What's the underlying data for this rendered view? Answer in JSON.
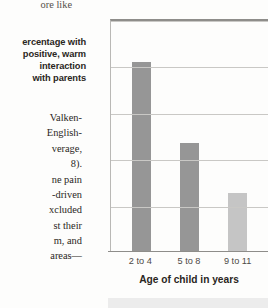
{
  "page": {
    "top_fragment": "ore like",
    "caption": "ercentage with\npositive, warm\ninteraction\nwith parents",
    "body_fragment_1": "Valken-\nEnglish-\nverage,\n8).\nne pain\n-driven\nxcluded\nst their\nm, and",
    "body_fragment_2": "areas—"
  },
  "chart_data": {
    "type": "bar",
    "title": "",
    "categories": [
      "2 to 4",
      "5 to 8",
      "9 to 11"
    ],
    "values": [
      81.5,
      47,
      25.5
    ],
    "xlabel": "Age of child in years",
    "ylabel": "Percentage with positive, warm interaction with parents",
    "ylim": [
      0,
      100
    ],
    "yticks": [
      0,
      20,
      40,
      60,
      80,
      100
    ],
    "ytick_labels": [
      "0",
      "20",
      "40",
      "60",
      "80",
      "100%"
    ],
    "grid": true,
    "legend": "none",
    "bar_colors": [
      "#969696",
      "#969696",
      "#c5c5c5"
    ],
    "axis_color": "#8e8d8a",
    "grid_color": "#c9c8c5"
  }
}
